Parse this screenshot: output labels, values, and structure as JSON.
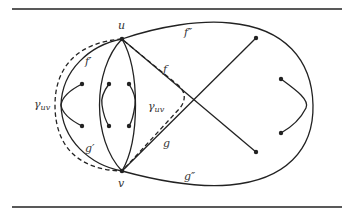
{
  "figure": {
    "type": "graph-drawing",
    "vertices": [
      {
        "id": "u",
        "label": "u"
      },
      {
        "id": "v",
        "label": "v"
      }
    ],
    "edge_labels": {
      "f": "f",
      "g": "g",
      "f_prime": "f′",
      "g_prime": "g′",
      "f_double_prime": "f″",
      "g_double_prime": "g″"
    },
    "curve_labels": {
      "gamma_left": "γ",
      "gamma_left_sub": "uv",
      "gamma_center": "γ",
      "gamma_center_sub": "uv"
    },
    "colors": {
      "stroke": "#222222",
      "background": "#ffffff"
    }
  }
}
